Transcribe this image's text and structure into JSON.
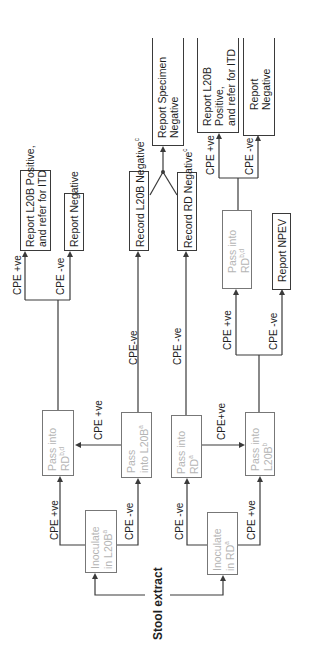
{
  "diagram": {
    "orientation": "rotated-90-ccw",
    "start": {
      "label": "Stool extract"
    },
    "inoculate": [
      {
        "id": "inoc_l20b",
        "line1": "Inoculate",
        "line2": "in L20B",
        "sup": "a"
      },
      {
        "id": "inoc_rd",
        "line1": "Inoculate",
        "line2": "in RD",
        "sup": "a"
      }
    ],
    "pass": [
      {
        "id": "pass_rd_1",
        "line1": "Pass into",
        "line2": "RD",
        "sup": "b,d"
      },
      {
        "id": "pass_l20b_1",
        "line1": "Pass",
        "line2": "into L20B",
        "sup": "a"
      },
      {
        "id": "pass_rd_2",
        "line1": "Pass into",
        "line2": "RD",
        "sup": "a"
      },
      {
        "id": "pass_l20b_2",
        "line1": "Pass into",
        "line2": "L20B",
        "sup": "b"
      },
      {
        "id": "pass_rd_3",
        "line1": "Pass into",
        "line2": "RD",
        "sup": "b,d"
      }
    ],
    "results": [
      {
        "id": "report_l20b_pos_1",
        "line1": "Report L20B Positive,",
        "line2": "and refer for ITD"
      },
      {
        "id": "report_neg_1",
        "line1": "Report Negative"
      },
      {
        "id": "record_l20b_neg",
        "line1": "Record L20B Negative",
        "sup": "c"
      },
      {
        "id": "record_rd_neg",
        "line1": "Record RD Negative",
        "sup": "c"
      },
      {
        "id": "report_specimen_neg",
        "line1": "Report Specimen",
        "line2": "Negative"
      },
      {
        "id": "report_npev",
        "line1": "Report NPEV"
      },
      {
        "id": "report_l20b_pos_2",
        "line1": "Report L20B",
        "line2": "Positive,",
        "line3": "and refer for ITD"
      },
      {
        "id": "report_neg_2",
        "line1": "Report",
        "line2": "Negative"
      }
    ],
    "edge_labels": {
      "cpe_pos": "CPE +ve",
      "cpe_neg": "CPE -ve",
      "cpe_pos_tight": "CPE+ve",
      "cpe_neg_tight": "CPE-ve"
    }
  },
  "colors": {
    "line": "#3a3a3a",
    "text": "#1e1e1e",
    "faint_text": "#b5b5b5",
    "background": "#ffffff"
  }
}
